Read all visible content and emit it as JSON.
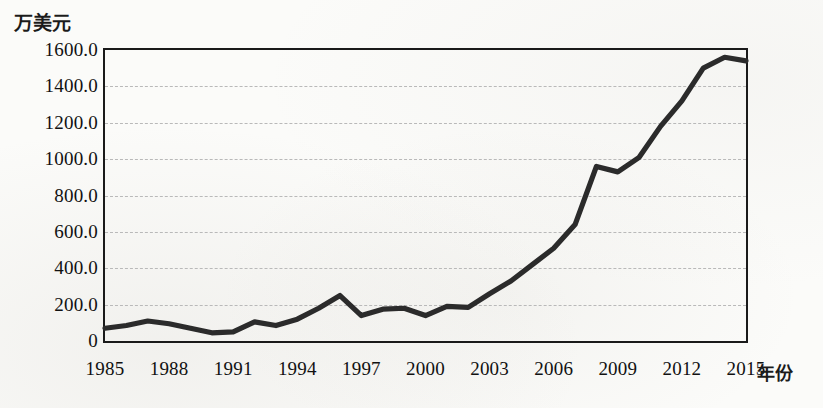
{
  "chart_data": {
    "type": "line",
    "title": "",
    "xlabel": "年份",
    "ylabel": "万美元",
    "ylim": [
      0,
      1600
    ],
    "xlim": [
      1985,
      2015
    ],
    "grid": true,
    "legend": "none",
    "y_ticks": [
      {
        "value": 1600,
        "label": "1600.0"
      },
      {
        "value": 1400,
        "label": "1400.0"
      },
      {
        "value": 1200,
        "label": "1200.0"
      },
      {
        "value": 1000,
        "label": "1000.0"
      },
      {
        "value": 800,
        "label": "800.0"
      },
      {
        "value": 600,
        "label": "600.0"
      },
      {
        "value": 400,
        "label": "400.0"
      },
      {
        "value": 200,
        "label": "200.0"
      },
      {
        "value": 0,
        "label": "0"
      }
    ],
    "x_ticks": [
      {
        "value": 1985,
        "label": "1985"
      },
      {
        "value": 1988,
        "label": "1988"
      },
      {
        "value": 1991,
        "label": "1991"
      },
      {
        "value": 1994,
        "label": "1994"
      },
      {
        "value": 1997,
        "label": "1997"
      },
      {
        "value": 2000,
        "label": "2000"
      },
      {
        "value": 2003,
        "label": "2003"
      },
      {
        "value": 2006,
        "label": "2006"
      },
      {
        "value": 2009,
        "label": "2009"
      },
      {
        "value": 2012,
        "label": "2012"
      },
      {
        "value": 2015,
        "label": "2015"
      }
    ],
    "x": [
      1985,
      1986,
      1987,
      1988,
      1989,
      1990,
      1991,
      1992,
      1993,
      1994,
      1995,
      1996,
      1997,
      1998,
      1999,
      2000,
      2001,
      2002,
      2003,
      2004,
      2005,
      2006,
      2007,
      2008,
      2009,
      2010,
      2011,
      2012,
      2013,
      2014,
      2015
    ],
    "values": [
      70,
      85,
      110,
      95,
      70,
      45,
      50,
      105,
      85,
      120,
      180,
      250,
      140,
      175,
      180,
      140,
      190,
      185,
      260,
      330,
      420,
      510,
      640,
      960,
      930,
      1010,
      1180,
      1320,
      1500,
      1560,
      1540
    ],
    "series": [
      {
        "name": "",
        "color": "#2b2b2b",
        "values": [
          70,
          85,
          110,
          95,
          70,
          45,
          50,
          105,
          85,
          120,
          180,
          250,
          140,
          175,
          180,
          140,
          190,
          185,
          260,
          330,
          420,
          510,
          640,
          960,
          930,
          1010,
          1180,
          1320,
          1500,
          1560,
          1540
        ]
      }
    ]
  },
  "axes": {
    "y_unit": "万美元",
    "x_unit": "年份"
  },
  "style": {
    "line_color": "#2b2b2b",
    "frame_color": "#1a1a1a",
    "grid_color": "#b9b9b9",
    "background": "#fbfbf9"
  }
}
